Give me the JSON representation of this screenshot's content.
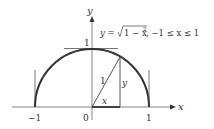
{
  "diagram": {
    "equation": {
      "lhs": "y = ",
      "radicand": "1 − x",
      "exponent": "2",
      "domain": ", −1 ≤ x ≤ 1"
    },
    "axes": {
      "x_label": "x",
      "y_label": "y"
    },
    "ticks": {
      "x_neg1": "−1",
      "origin": "0",
      "x_pos1": "1",
      "y_one": "1"
    },
    "triangle": {
      "hypotenuse_label": "1",
      "vertical_label": "y",
      "horizontal_label": "x"
    },
    "colors": {
      "curve": "#333333",
      "axis": "#555555",
      "text": "#333333"
    }
  }
}
